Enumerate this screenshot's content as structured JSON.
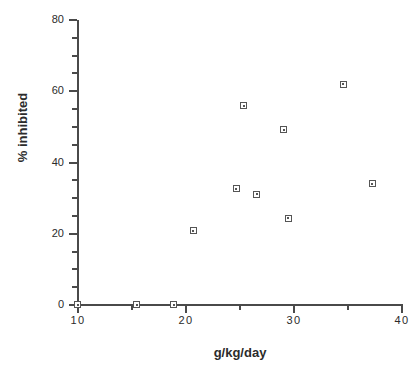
{
  "chart_data": {
    "type": "scatter",
    "title": "",
    "xlabel": "g/kg/day",
    "ylabel": "% inhibited",
    "xlim": [
      10,
      40
    ],
    "ylim": [
      0,
      80
    ],
    "grid": false,
    "legend": null,
    "xticks": [
      10,
      20,
      30,
      40
    ],
    "xticklabels": [
      "10",
      "20",
      "30",
      "40"
    ],
    "x_minor_ticks": [
      15,
      25,
      35
    ],
    "yticks": [
      0,
      20,
      40,
      60,
      80
    ],
    "yticklabels": [
      "0",
      "20",
      "40",
      "60",
      "80"
    ],
    "y_minor_ticks": [
      5,
      10,
      15,
      25,
      30,
      35,
      45,
      50,
      55,
      65,
      70,
      75
    ],
    "marker": "open-square",
    "marker_color": "#555555",
    "points": [
      {
        "x": 10.0,
        "y": 0.0
      },
      {
        "x": 15.5,
        "y": 0.0
      },
      {
        "x": 18.9,
        "y": 0.0
      },
      {
        "x": 20.7,
        "y": 20.7
      },
      {
        "x": 24.7,
        "y": 32.5
      },
      {
        "x": 25.4,
        "y": 55.8
      },
      {
        "x": 26.6,
        "y": 31.0
      },
      {
        "x": 29.1,
        "y": 49.0
      },
      {
        "x": 29.5,
        "y": 24.2
      },
      {
        "x": 34.6,
        "y": 61.8
      },
      {
        "x": 37.3,
        "y": 33.9
      }
    ]
  },
  "axes": {
    "x_title": "g/kg/day",
    "y_title": "% inhibited"
  }
}
